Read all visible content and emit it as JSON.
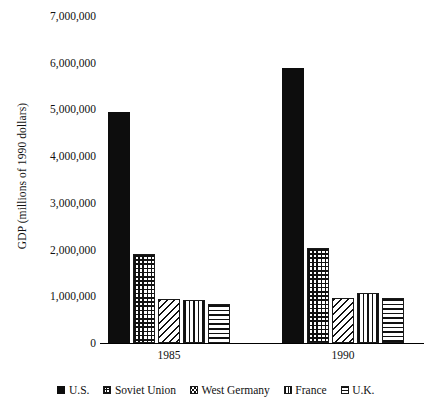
{
  "chart_data": {
    "type": "bar",
    "title": "",
    "xlabel": "",
    "ylabel": "GDP (millions of 1990 dollars)",
    "categories": [
      "1985",
      "1990"
    ],
    "series": [
      {
        "name": "U.S.",
        "pattern": "solid",
        "values": [
          4950000,
          5880000
        ]
      },
      {
        "name": "Soviet Union",
        "pattern": "grid",
        "values": [
          1900000,
          2030000
        ]
      },
      {
        "name": "West Germany",
        "pattern": "diagonal",
        "values": [
          940000,
          960000
        ]
      },
      {
        "name": "France",
        "pattern": "vertical",
        "values": [
          910000,
          1080000
        ]
      },
      {
        "name": "U.K.",
        "pattern": "horizontal",
        "values": [
          830000,
          960000
        ]
      }
    ],
    "ylim": [
      0,
      7000000
    ],
    "ytick_values": [
      0,
      1000000,
      2000000,
      3000000,
      4000000,
      5000000,
      6000000,
      7000000
    ],
    "ytick_labels": [
      "0",
      "1,000,000",
      "2,000,000",
      "3,000,000",
      "4,000,000",
      "5,000,000",
      "6,000,000",
      "7,000,000"
    ],
    "grid": false,
    "legend_position": "bottom",
    "colors": {
      "ink": "#111111",
      "background": "#ffffff",
      "solid_fill": "#0d0d0d"
    }
  },
  "axis": {
    "y_title": "GDP (millions of 1990 dollars)",
    "y_ticks": [
      "7,000,000",
      "6,000,000",
      "5,000,000",
      "4,000,000",
      "3,000,000",
      "2,000,000",
      "1,000,000",
      "0"
    ],
    "x_ticks": [
      "1985",
      "1990"
    ]
  },
  "legend": {
    "items": [
      {
        "label": "U.S.",
        "swatch": "solid-swatch-icon"
      },
      {
        "label": "Soviet Union",
        "swatch": "grid-hatch-swatch-icon"
      },
      {
        "label": "West Germany",
        "swatch": "diagonal-hatch-swatch-icon"
      },
      {
        "label": "France",
        "swatch": "vertical-hatch-swatch-icon"
      },
      {
        "label": "U.K.",
        "swatch": "horizontal-hatch-swatch-icon"
      }
    ]
  }
}
